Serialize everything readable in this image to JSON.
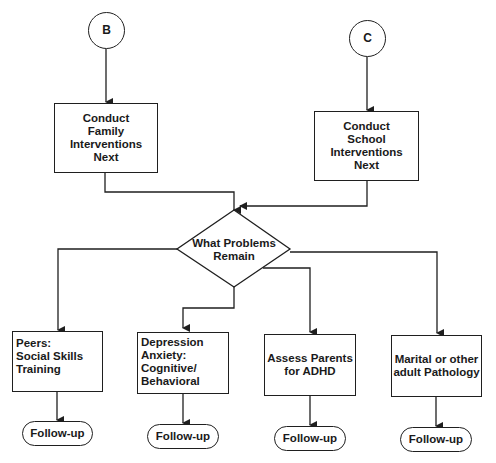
{
  "connectors": {
    "b": "B",
    "c": "C"
  },
  "entry_boxes": {
    "family": [
      "Conduct",
      "Family",
      "Interventions",
      "Next"
    ],
    "school": [
      "Conduct",
      "School Interventions",
      "Next"
    ]
  },
  "decision": {
    "lines": [
      "What Problems",
      "Remain"
    ]
  },
  "branches": [
    {
      "id": "peers",
      "lines": [
        "Peers:",
        "Social Skills",
        "Training"
      ],
      "follow_up": "Follow-up"
    },
    {
      "id": "depression-anxiety",
      "lines": [
        "Depression",
        "Anxiety:",
        "Cognitive/",
        "Behavioral"
      ],
      "follow_up": "Follow-up"
    },
    {
      "id": "parents-adhd",
      "lines": [
        "Assess Parents",
        "for ADHD"
      ],
      "follow_up": "Follow-up"
    },
    {
      "id": "adult-pathology",
      "lines": [
        "Marital or other",
        "adult Pathology"
      ],
      "follow_up": "Follow-up"
    }
  ],
  "colors": {
    "stroke": "#1f1f1f",
    "background": "#ffffff"
  }
}
